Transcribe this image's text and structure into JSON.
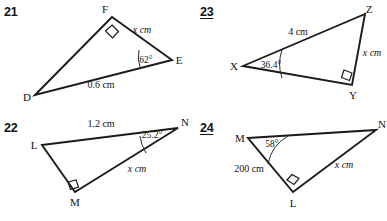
{
  "worksheet": {
    "title": "Right triangle trigonometry figures",
    "background_color": "#ffffff",
    "line_color": "#1b1b1b"
  },
  "problems": [
    {
      "number": "21",
      "underlined": false,
      "vertices": [
        {
          "label": "D"
        },
        {
          "label": "F"
        },
        {
          "label": "E"
        }
      ],
      "right_angle_at": "F",
      "angle": {
        "vertex": "E",
        "value": "62°"
      },
      "sides": [
        {
          "label": "x cm",
          "italic": true
        },
        {
          "label": "0.6 cm",
          "italic": false
        }
      ]
    },
    {
      "number": "23",
      "underlined": true,
      "vertices": [
        {
          "label": "X"
        },
        {
          "label": "Z"
        },
        {
          "label": "Y"
        }
      ],
      "right_angle_at": "Y",
      "angle": {
        "vertex": "X",
        "value": "36.4°"
      },
      "sides": [
        {
          "label": "4 cm",
          "italic": false
        },
        {
          "label": "x cm",
          "italic": true
        }
      ]
    },
    {
      "number": "22",
      "underlined": false,
      "vertices": [
        {
          "label": "L"
        },
        {
          "label": "N"
        },
        {
          "label": "M"
        }
      ],
      "right_angle_at": "M",
      "angle": {
        "vertex": "N",
        "value": "25.2°"
      },
      "sides": [
        {
          "label": "1.2 cm",
          "italic": false
        },
        {
          "label": "x cm",
          "italic": true
        }
      ]
    },
    {
      "number": "24",
      "underlined": true,
      "vertices": [
        {
          "label": "M"
        },
        {
          "label": "N"
        },
        {
          "label": "L"
        }
      ],
      "right_angle_at": "L",
      "angle": {
        "vertex": "M",
        "value": "58°"
      },
      "sides": [
        {
          "label": "200 cm",
          "italic": false
        },
        {
          "label": "x cm",
          "italic": true
        }
      ]
    }
  ]
}
